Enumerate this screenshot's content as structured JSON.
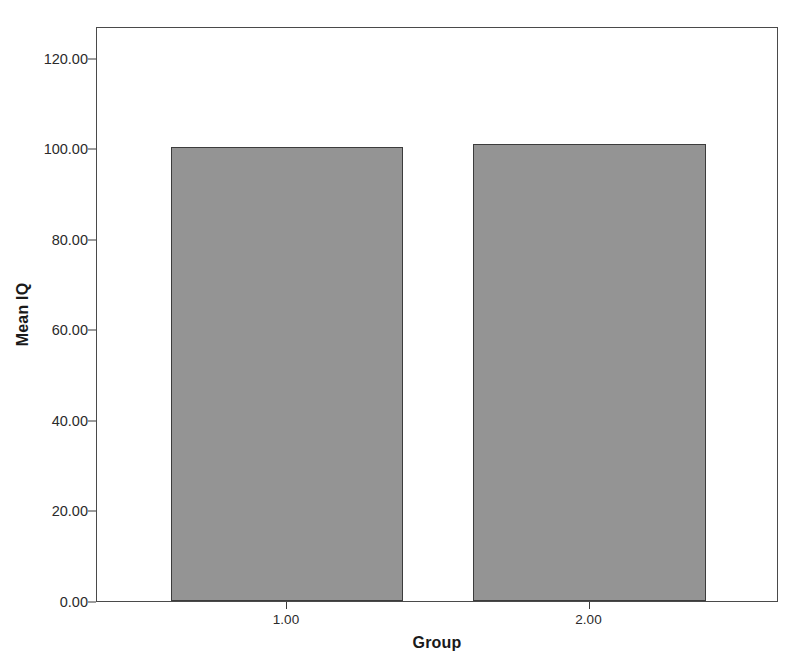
{
  "chart_data": {
    "type": "bar",
    "title": "",
    "subtitle": "",
    "xlabel": "Group",
    "ylabel": "Mean IQ",
    "categories": [
      "1.00",
      "2.00"
    ],
    "values": [
      100.3,
      101.0
    ],
    "series": [
      {
        "name": "Mean IQ",
        "values": [
          100.3,
          101.0
        ]
      }
    ],
    "ylim": [
      0,
      127
    ],
    "y_ticks": [
      0,
      20,
      40,
      60,
      80,
      100,
      120
    ],
    "y_tick_labels": [
      "0.00",
      "20.00",
      "40.00",
      "60.00",
      "80.00",
      "100.00",
      "120.00"
    ],
    "x_tick_labels": [
      "1.00",
      "2.00"
    ],
    "grid": false,
    "legend": false,
    "legend_position": "none",
    "bar_color": "#949494",
    "bar_edge_color": "#3c3c3c",
    "axis_color": "#4a4a4a",
    "background_color": "#ffffff",
    "text_color": "#1a1a1a"
  }
}
